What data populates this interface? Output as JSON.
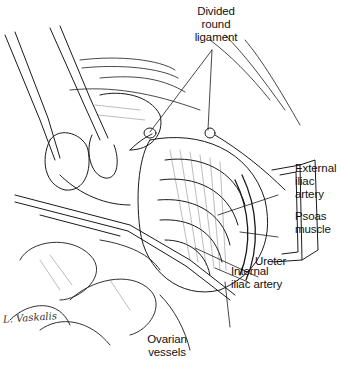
{
  "figure": {
    "type": "surgical anatomical line illustration",
    "background": "#ffffff",
    "ink_color": "#1a1a1a"
  },
  "labels": {
    "divided_round_ligament": "Divided\nround\nligament",
    "external_iliac_artery": "External\niliac\nartery",
    "psoas_muscle": "Psoas\nmuscle",
    "ureter": "Ureter",
    "internal_iliac_artery": "Internal\niliac artery",
    "ovarian_vessels": "Ovarian\nvessels"
  },
  "signature": "L. Vaskalis"
}
